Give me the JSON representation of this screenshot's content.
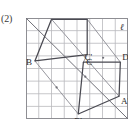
{
  "figure": {
    "number_label": "(2)",
    "caption": "",
    "line_label": "ℓ"
  },
  "grid": {
    "cols": 8,
    "rows": 8,
    "cell_px": 12.75,
    "origin_x": 26,
    "origin_y": 18,
    "line_color": "#b9b9bd",
    "border_color": "#8e8e93",
    "show": true
  },
  "colors": {
    "shape_stroke": "#4a4a52",
    "thin_stroke": "#8b8b93",
    "axis_stroke": "#6f6f77",
    "label_fill": "#2b2b2b",
    "background": "#ffffff"
  },
  "chart_data": {
    "type": "diagram",
    "axis_line": {
      "name": "ℓ",
      "from": [
        0,
        8
      ],
      "to": [
        8,
        0
      ],
      "label": "ℓ"
    },
    "grid": {
      "x": [
        0,
        8
      ],
      "y": [
        0,
        8
      ],
      "step": 1
    },
    "shapes": [
      {
        "name": "ABCD",
        "closed": true,
        "vertices": [
          {
            "label": "A",
            "x": 2.0,
            "y": 7.9,
            "label_dx": -7,
            "label_dy": -2
          },
          {
            "label": "B",
            "x": 0.7,
            "y": 4.6,
            "label_dx": -9,
            "label_dy": 4
          },
          {
            "label": "C",
            "x": 4.8,
            "y": 5.1,
            "label_dx": -1,
            "label_dy": 10
          },
          {
            "label": "D",
            "x": 4.8,
            "y": 7.9,
            "label_dx": -2,
            "label_dy": -2
          }
        ]
      },
      {
        "name": "A'B'C'D'",
        "closed": true,
        "vertices": [
          {
            "label": "A'",
            "x": 7.3,
            "y": 1.8,
            "label_dx": 2,
            "label_dy": 8
          },
          {
            "label": "B'",
            "x": 4.1,
            "y": 0.4,
            "label_dx": -4,
            "label_dy": 10
          },
          {
            "label": "C'",
            "x": 4.5,
            "y": 4.5,
            "label_dx": 1,
            "label_dy": -2
          },
          {
            "label": "D'",
            "x": 7.4,
            "y": 4.5,
            "label_dx": 2,
            "label_dy": -2
          }
        ]
      }
    ],
    "connectors": [
      {
        "from": "A",
        "to": "A'",
        "style": "thin"
      },
      {
        "from": "B",
        "to": "B'",
        "style": "thin"
      },
      {
        "from": "C",
        "to": "C'",
        "style": "thin"
      },
      {
        "from": "D",
        "to": "D'",
        "style": "thin"
      }
    ],
    "midpoints": [
      {
        "x": 4.65,
        "y": 3.35
      },
      {
        "x": 6.05,
        "y": 4.85
      },
      {
        "x": 2.4,
        "y": 2.5
      }
    ],
    "xlabel": "",
    "ylabel": "",
    "legend": []
  }
}
